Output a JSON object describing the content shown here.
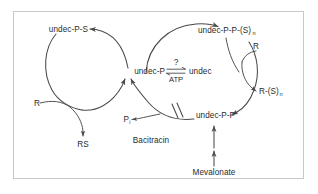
{
  "figure": {
    "frame_color": "#c8c8c8",
    "line_color": "#4a4a4a",
    "text_color": "#2b2b2b",
    "background": "#ffffff"
  },
  "labels": {
    "undec_p_s": "undec-P-S",
    "undec_p": "undec-P",
    "undec": "undec",
    "undec_pp_sn_main": "undec-P-P-(S)",
    "undec_pp_sn_sub": "n",
    "undec_pp": "undec-P-P",
    "r_left": "R",
    "r_right": "R",
    "rs": "RS",
    "r_sn_main": "R-(S)",
    "r_sn_sub": "n",
    "pi_main": "P",
    "pi_sub": "i",
    "bacitracin": "Bacitracin",
    "mevalonate": "Mevalonate",
    "atp": "ATP",
    "question": "?"
  },
  "icons": {
    "equilibrium": "equilibrium-arrows-icon",
    "inhibition": "double-slash-inhibition-icon",
    "arrowhead": "arrowhead-icon"
  }
}
